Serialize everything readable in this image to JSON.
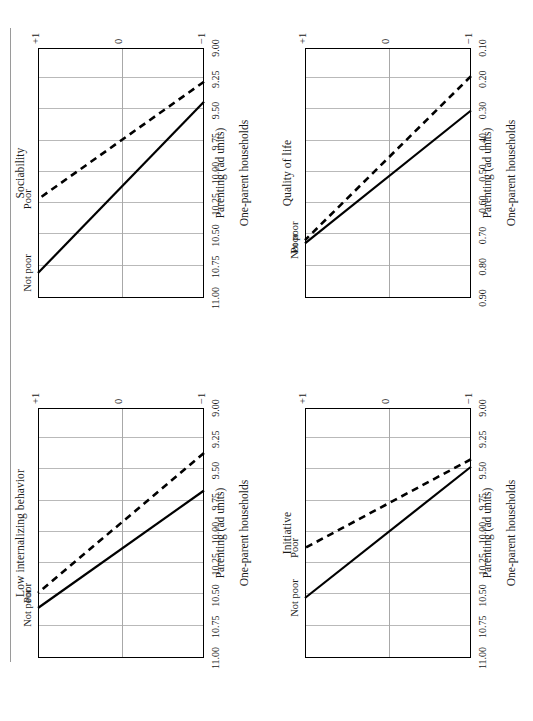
{
  "figure": {
    "orientation": "rotated-90-ccw",
    "group_label": "One-parent households",
    "xlabel": "Parenting (ad units)",
    "xticks": [
      "−1",
      "0",
      "+1"
    ],
    "series_names": {
      "solid": "Not poor",
      "dashed": "Poor"
    },
    "colors": {
      "line": "#000000",
      "grid": "#b9b9b9",
      "axis": "#000000",
      "rule": "#9a9a9a"
    }
  },
  "panels": [
    {
      "id": "low-internalizing-behavior",
      "title": "Low internalizing behavior",
      "yticks": [
        "11.00",
        "10.75",
        "10.50",
        "10.25",
        "10.00",
        "9.75",
        "9.50",
        "9.25",
        "9.00"
      ],
      "ylim": [
        9.0,
        11.0
      ],
      "label_solid": "Not poor",
      "label_dashed": "Poor"
    },
    {
      "id": "sociability",
      "title": "Sociability",
      "yticks": [
        "11.00",
        "10.75",
        "10.50",
        "10.25",
        "10.00",
        "9.75",
        "9.50",
        "9.25",
        "9.00"
      ],
      "ylim": [
        9.0,
        11.0
      ],
      "label_solid": "Not poor",
      "label_dashed": "Poor"
    },
    {
      "id": "initiative",
      "title": "Initiative",
      "yticks": [
        "11.00",
        "10.75",
        "10.50",
        "10.25",
        "10.00",
        "9.75",
        "9.50",
        "9.25",
        "9.00"
      ],
      "ylim": [
        9.0,
        11.0
      ],
      "label_solid": "Not poor",
      "label_dashed": "Poor"
    },
    {
      "id": "quality-of-life",
      "title": "Quality of life",
      "yticks": [
        "0.90",
        "0.80",
        "0.70",
        "0.60",
        "0.50",
        "0.40",
        "0.30",
        "0.20",
        "0.10"
      ],
      "ylim": [
        0.1,
        0.9
      ],
      "label_solid": "Poor",
      "label_dashed": "Not poor"
    }
  ],
  "chart_data": {
    "type": "line",
    "xlabel": "Parenting (ad units)",
    "group_label": "One-parent households",
    "x": [
      -1,
      1
    ],
    "xlim": [
      -1,
      1
    ],
    "xticks": [
      -1,
      0,
      1
    ],
    "grid": "vertical",
    "legend": "inline-endpoint-labels",
    "panels": [
      {
        "title": "Low internalizing behavior",
        "ylabel": "",
        "ylim": [
          9.0,
          11.0
        ],
        "yticks": [
          9.0,
          9.25,
          9.5,
          9.75,
          10.0,
          10.25,
          10.5,
          10.75,
          11.0
        ],
        "series": [
          {
            "name": "Not poor",
            "style": "solid",
            "values": [
              9.66,
              10.6
            ]
          },
          {
            "name": "Poor",
            "style": "dashed",
            "values": [
              9.36,
              10.48
            ]
          }
        ]
      },
      {
        "title": "Sociability",
        "ylabel": "",
        "ylim": [
          9.0,
          11.0
        ],
        "yticks": [
          9.0,
          9.25,
          9.5,
          9.75,
          10.0,
          10.25,
          10.5,
          10.75,
          11.0
        ],
        "series": [
          {
            "name": "Not poor",
            "style": "solid",
            "values": [
              9.43,
              10.8
            ]
          },
          {
            "name": "Poor",
            "style": "dashed",
            "values": [
              9.27,
              10.21
            ]
          }
        ]
      },
      {
        "title": "Initiative",
        "ylabel": "",
        "ylim": [
          9.0,
          11.0
        ],
        "yticks": [
          9.0,
          9.25,
          9.5,
          9.75,
          10.0,
          10.25,
          10.5,
          10.75,
          11.0
        ],
        "series": [
          {
            "name": "Not poor",
            "style": "solid",
            "values": [
              9.47,
              10.52
            ]
          },
          {
            "name": "Poor",
            "style": "dashed",
            "values": [
              9.41,
              10.12
            ]
          }
        ]
      },
      {
        "title": "Quality of life",
        "ylabel": "",
        "ylim": [
          0.1,
          0.9
        ],
        "yticks": [
          0.1,
          0.2,
          0.3,
          0.4,
          0.5,
          0.6,
          0.7,
          0.8,
          0.9
        ],
        "series": [
          {
            "name": "Poor",
            "style": "solid",
            "values": [
              0.3,
              0.725
            ]
          },
          {
            "name": "Not poor",
            "style": "dashed",
            "values": [
              0.19,
              0.715
            ]
          }
        ]
      }
    ]
  }
}
